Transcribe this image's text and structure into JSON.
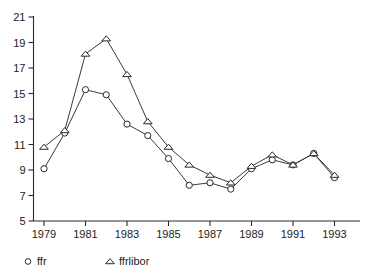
{
  "chart_data": {
    "type": "line",
    "title": "",
    "subtitle": "",
    "xlabel": "",
    "ylabel": "",
    "grid": false,
    "legend_position": "bottom-left",
    "x": [
      1979,
      1980,
      1981,
      1982,
      1983,
      1984,
      1985,
      1986,
      1987,
      1988,
      1989,
      1990,
      1991,
      1992,
      1993
    ],
    "xlim": [
      1978.5,
      1993.5
    ],
    "ylim": [
      5,
      21
    ],
    "x_tick_labels": [
      "1979",
      "1981",
      "1983",
      "1985",
      "1987",
      "1989",
      "1991",
      "1993"
    ],
    "x_tick_values": [
      1979,
      1981,
      1983,
      1985,
      1987,
      1989,
      1991,
      1993
    ],
    "y_tick_labels": [
      "5",
      "7",
      "9",
      "11",
      "13",
      "15",
      "17",
      "19",
      "21"
    ],
    "y_tick_values": [
      5,
      7,
      9,
      11,
      13,
      15,
      17,
      19,
      21
    ],
    "series": [
      {
        "name": "ffr",
        "marker": "circle",
        "values": [
          9.1,
          11.9,
          15.3,
          14.9,
          12.6,
          11.7,
          9.9,
          7.8,
          8.0,
          7.5,
          9.1,
          9.8,
          9.4,
          10.3,
          8.4
        ]
      },
      {
        "name": "ffrlibor",
        "marker": "triangle",
        "values": [
          10.8,
          12.1,
          18.1,
          19.3,
          16.5,
          12.8,
          10.8,
          9.4,
          8.6,
          8.0,
          9.3,
          10.2,
          9.4,
          10.3,
          8.6
        ]
      }
    ]
  },
  "legend": {
    "items": [
      {
        "label": "ffr",
        "marker": "circle"
      },
      {
        "label": "ffrlibor",
        "marker": "triangle"
      }
    ]
  },
  "colors": {
    "axis": "#2a2a2a",
    "line": "#3a3a3a",
    "marker_fill": "#ffffff",
    "text": "#1c1c1c",
    "background": "#ffffff"
  }
}
